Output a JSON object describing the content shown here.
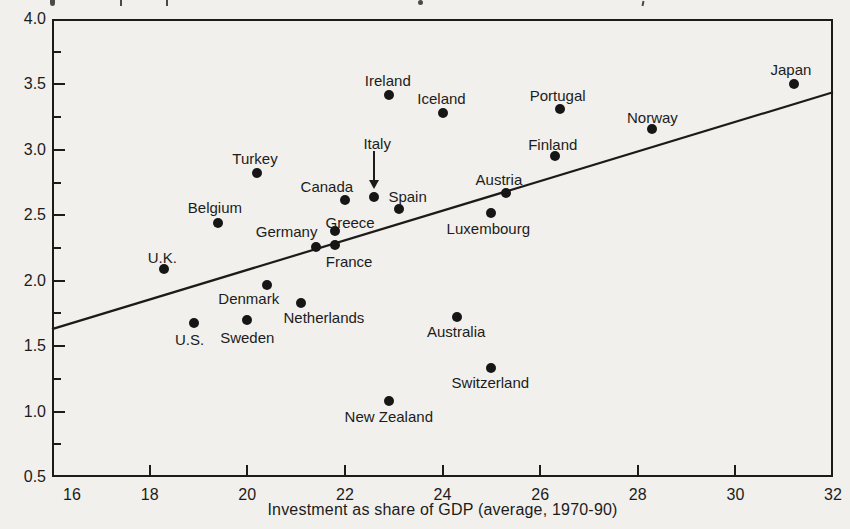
{
  "chart_data": {
    "type": "scatter",
    "title": "",
    "xlabel": "Investment as share of GDP (average, 1970-90)",
    "ylabel": "",
    "xlim": [
      16,
      32
    ],
    "ylim": [
      0.5,
      4.0
    ],
    "x_ticks": [
      16,
      18,
      20,
      22,
      24,
      26,
      28,
      30,
      32
    ],
    "y_ticks": [
      0.5,
      1.0,
      1.5,
      2.0,
      2.5,
      3.0,
      3.5,
      4.0
    ],
    "y_minor_tick_step": 0.25,
    "grid": false,
    "legend": "none",
    "marker": {
      "shape": "circle",
      "color": "#161616",
      "size_px": 10
    },
    "ink_color": "#1b1b1b",
    "paper_color": "#f2f0ec",
    "trend_line": {
      "x1": 16,
      "y1": 1.63,
      "x2": 32,
      "y2": 3.44
    },
    "x_tick_label_dx": {
      "16": 20
    },
    "points": [
      {
        "name": "U.K.",
        "x": 18.3,
        "y": 2.09,
        "label_dx": -2,
        "label_dy": -12
      },
      {
        "name": "U.S.",
        "x": 18.9,
        "y": 1.68,
        "label_dx": -4,
        "label_dy": 16
      },
      {
        "name": "Belgium",
        "x": 19.4,
        "y": 2.44,
        "label_dx": -3,
        "label_dy": -16
      },
      {
        "name": "Sweden",
        "x": 20.0,
        "y": 1.7,
        "label_dx": 0,
        "label_dy": 17
      },
      {
        "name": "Turkey",
        "x": 20.2,
        "y": 2.82,
        "label_dx": -2,
        "label_dy": -15
      },
      {
        "name": "Denmark",
        "x": 20.4,
        "y": 1.97,
        "label_dx": -18,
        "label_dy": 13
      },
      {
        "name": "Netherlands",
        "x": 21.1,
        "y": 1.83,
        "label_dx": 23,
        "label_dy": 14
      },
      {
        "name": "Germany",
        "x": 21.4,
        "y": 2.26,
        "label_dx": -29,
        "label_dy": -16
      },
      {
        "name": "France",
        "x": 21.8,
        "y": 2.27,
        "label_dx": 14,
        "label_dy": 16
      },
      {
        "name": "Greece",
        "x": 21.8,
        "y": 2.38,
        "label_dx": 15,
        "label_dy": -9
      },
      {
        "name": "Canada",
        "x": 22.0,
        "y": 2.62,
        "label_dx": -18,
        "label_dy": -14
      },
      {
        "name": "Italy",
        "x": 22.6,
        "y": 2.64,
        "label_dx": 3,
        "label_dy": -54,
        "arrow": true
      },
      {
        "name": "Ireland",
        "x": 22.9,
        "y": 3.42,
        "label_dx": -1,
        "label_dy": -15
      },
      {
        "name": "New Zealand",
        "x": 22.9,
        "y": 1.08,
        "label_dx": 0,
        "label_dy": 15
      },
      {
        "name": "Spain",
        "x": 23.1,
        "y": 2.55,
        "label_dx": 9,
        "label_dy": -13
      },
      {
        "name": "Iceland",
        "x": 24.0,
        "y": 3.28,
        "label_dx": -1,
        "label_dy": -15
      },
      {
        "name": "Australia",
        "x": 24.3,
        "y": 1.72,
        "label_dx": -1,
        "label_dy": 14
      },
      {
        "name": "Luxembourg",
        "x": 25.0,
        "y": 2.52,
        "label_dx": -3,
        "label_dy": 15
      },
      {
        "name": "Switzerland",
        "x": 25.0,
        "y": 1.33,
        "label_dx": -1,
        "label_dy": 14
      },
      {
        "name": "Austria",
        "x": 25.3,
        "y": 2.67,
        "label_dx": -7,
        "label_dy": -14
      },
      {
        "name": "Finland",
        "x": 26.3,
        "y": 2.95,
        "label_dx": -2,
        "label_dy": -12
      },
      {
        "name": "Portugal",
        "x": 26.4,
        "y": 3.31,
        "label_dx": -2,
        "label_dy": -14
      },
      {
        "name": "Norway",
        "x": 28.3,
        "y": 3.16,
        "label_dx": 0,
        "label_dy": -12
      },
      {
        "name": "Japan",
        "x": 31.2,
        "y": 3.5,
        "label_dx": -3,
        "label_dy": -15
      }
    ]
  }
}
